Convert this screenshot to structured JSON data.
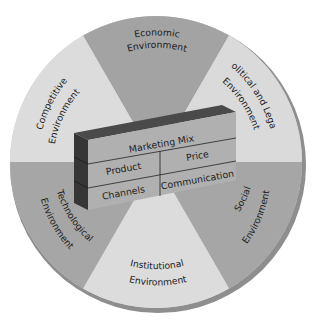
{
  "diagram": {
    "center_block": {
      "header": "Marketing Mix",
      "cells": {
        "product": "Product",
        "price": "Price",
        "channels": "Channels",
        "communication": "Communication"
      }
    },
    "sectors": [
      {
        "id": "economic",
        "line1": "Economic",
        "line2": "Environment",
        "shade": "dark"
      },
      {
        "id": "political-legal",
        "line1": "Political and Legal",
        "line2": "Environment",
        "shade": "light"
      },
      {
        "id": "social",
        "line1": "Social",
        "line2": "Environment",
        "shade": "dark"
      },
      {
        "id": "institutional",
        "line1": "Institutional",
        "line2": "Environment",
        "shade": "light"
      },
      {
        "id": "technological",
        "line1": "Technological",
        "line2": "Environment",
        "shade": "dark"
      },
      {
        "id": "competitive",
        "line1": "Competitive",
        "line2": "Environment",
        "shade": "light"
      }
    ],
    "colors": {
      "dark_sector": "#a3a3a3",
      "light_sector": "#dcdcdc",
      "rim": "#8e8e8e",
      "block_front": "#b2b2b2",
      "block_top": "#4a4a4a",
      "block_side": "#3a3a3a",
      "text": "#1c1c1c"
    }
  }
}
